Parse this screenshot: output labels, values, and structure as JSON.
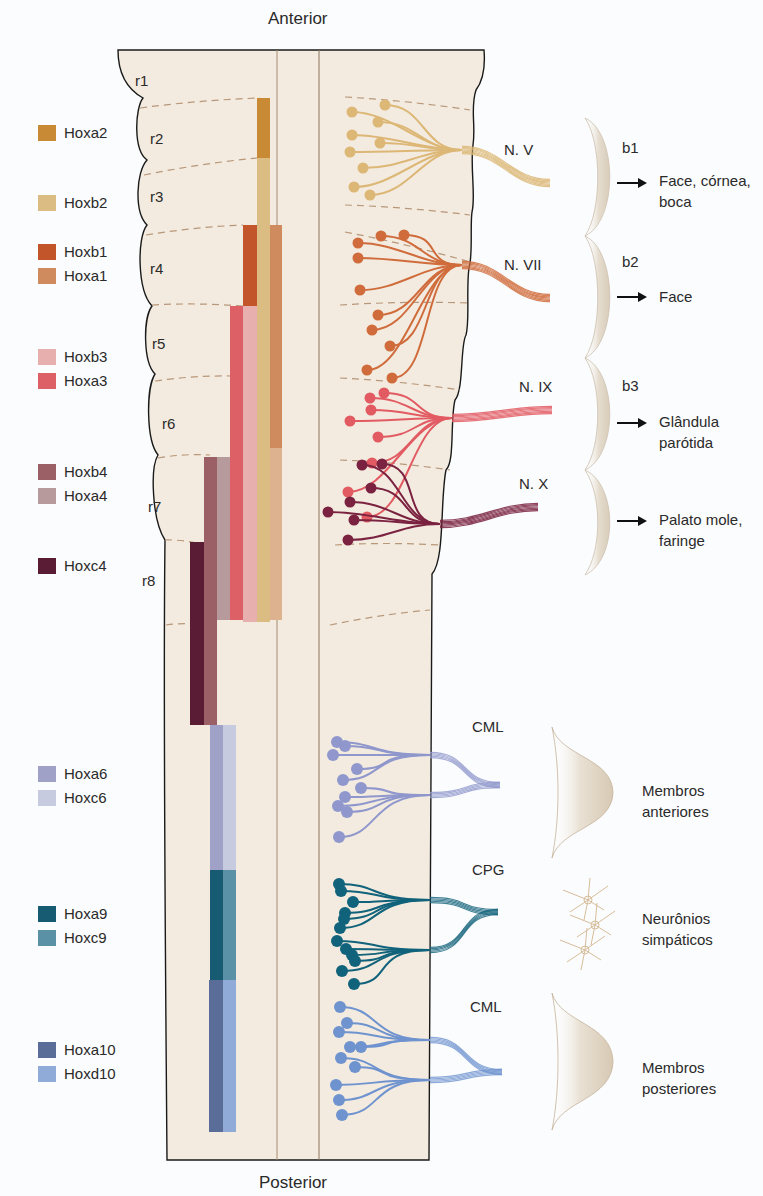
{
  "axis": {
    "top": "Anterior",
    "bottom": "Posterior"
  },
  "rhombomeres": [
    {
      "label": "r1",
      "x": 135,
      "y": 72
    },
    {
      "label": "r2",
      "x": 150,
      "y": 130
    },
    {
      "label": "r3",
      "x": 150,
      "y": 188
    },
    {
      "label": "r4",
      "x": 150,
      "y": 260
    },
    {
      "label": "r5",
      "x": 152,
      "y": 335
    },
    {
      "label": "r6",
      "x": 162,
      "y": 415
    },
    {
      "label": "r7",
      "x": 148,
      "y": 498
    },
    {
      "label": "r8",
      "x": 142,
      "y": 572
    }
  ],
  "legend": [
    {
      "gene": "Hoxa2",
      "color": "#c98a35",
      "y": 133
    },
    {
      "gene": "Hoxb2",
      "color": "#dbbd84",
      "y": 203
    },
    {
      "gene": "Hoxb1",
      "color": "#c2552a",
      "y": 252
    },
    {
      "gene": "Hoxa1",
      "color": "#cf8a5e",
      "y": 276
    },
    {
      "gene": "Hoxb3",
      "color": "#e7afae",
      "y": 357
    },
    {
      "gene": "Hoxa3",
      "color": "#dc6066",
      "y": 381
    },
    {
      "gene": "Hoxb4",
      "color": "#9a6066",
      "y": 472
    },
    {
      "gene": "Hoxa4",
      "color": "#b79a9c",
      "y": 496
    },
    {
      "gene": "Hoxc4",
      "color": "#5a1c35",
      "y": 566
    },
    {
      "gene": "Hoxa6",
      "color": "#9fa1c7",
      "y": 774
    },
    {
      "gene": "Hoxc6",
      "color": "#c7cbe0",
      "y": 798
    },
    {
      "gene": "Hoxa9",
      "color": "#165b72",
      "y": 914
    },
    {
      "gene": "Hoxc9",
      "color": "#5b91a6",
      "y": 938
    },
    {
      "gene": "Hoxa10",
      "color": "#5a6d98",
      "y": 1050
    },
    {
      "gene": "Hoxd10",
      "color": "#90abd7",
      "y": 1074
    }
  ],
  "expression_bars": [
    {
      "gene": "Hoxa2",
      "color": "#c98a35",
      "x": 257,
      "w": 13,
      "y0": 98,
      "y1": 158
    },
    {
      "gene": "Hoxb2",
      "color": "#dbbd84",
      "x": 257,
      "w": 13,
      "y0": 158,
      "y1": 622
    },
    {
      "gene": "Hoxb1",
      "color": "#c2552a",
      "x": 243,
      "w": 14,
      "y0": 225,
      "y1": 306
    },
    {
      "gene": "Hoxa1",
      "color": "#cf8a5e",
      "x": 270,
      "w": 12,
      "y0": 225,
      "y1": 448
    },
    {
      "gene": "Hoxa1-fade",
      "color": "#ddb28f",
      "x": 270,
      "w": 12,
      "y0": 448,
      "y1": 620
    },
    {
      "gene": "Hoxb3",
      "color": "#e7afae",
      "x": 243,
      "w": 14,
      "y0": 306,
      "y1": 622
    },
    {
      "gene": "Hoxa3",
      "color": "#dc6066",
      "x": 230,
      "w": 13,
      "y0": 306,
      "y1": 620
    },
    {
      "gene": "Hoxa4",
      "color": "#b79a9c",
      "x": 217,
      "w": 13,
      "y0": 457,
      "y1": 620
    },
    {
      "gene": "Hoxb4",
      "color": "#9a6066",
      "x": 204,
      "w": 13,
      "y0": 457,
      "y1": 725
    },
    {
      "gene": "Hoxc4",
      "color": "#5a1c35",
      "x": 190,
      "w": 14,
      "y0": 542,
      "y1": 725
    },
    {
      "gene": "Hoxa6",
      "color": "#9fa1c7",
      "x": 210,
      "w": 13,
      "y0": 725,
      "y1": 870
    },
    {
      "gene": "Hoxc6",
      "color": "#c7cbe0",
      "x": 223,
      "w": 13,
      "y0": 725,
      "y1": 870
    },
    {
      "gene": "Hoxa9",
      "color": "#165b72",
      "x": 210,
      "w": 13,
      "y0": 870,
      "y1": 980
    },
    {
      "gene": "Hoxc9",
      "color": "#5b91a6",
      "x": 223,
      "w": 13,
      "y0": 870,
      "y1": 980
    },
    {
      "gene": "Hoxa10",
      "color": "#5a6d98",
      "x": 209,
      "w": 14,
      "y0": 980,
      "y1": 1132
    },
    {
      "gene": "Hoxd10",
      "color": "#90abd7",
      "x": 223,
      "w": 13,
      "y0": 980,
      "y1": 1132
    }
  ],
  "nerves": [
    {
      "name": "N. V",
      "label_x": 504,
      "label_y": 150,
      "color": "#dcb776",
      "exit_y": 150,
      "tail_end": [
        550,
        183
      ],
      "somata": [
        [
          352,
          112
        ],
        [
          385,
          105
        ],
        [
          378,
          122
        ],
        [
          352,
          135
        ],
        [
          380,
          143
        ],
        [
          350,
          152
        ],
        [
          363,
          168
        ],
        [
          354,
          187
        ],
        [
          370,
          195
        ]
      ]
    },
    {
      "name": "N. VII",
      "label_x": 504,
      "label_y": 265,
      "color": "#d06c3c",
      "exit_y": 265,
      "tail_end": [
        550,
        298
      ],
      "somata": [
        [
          358,
          243
        ],
        [
          381,
          236
        ],
        [
          404,
          235
        ],
        [
          358,
          258
        ],
        [
          360,
          290
        ],
        [
          378,
          315
        ],
        [
          372,
          330
        ],
        [
          390,
          346
        ],
        [
          367,
          370
        ],
        [
          392,
          378
        ]
      ]
    },
    {
      "name": "N. IX",
      "label_x": 519,
      "label_y": 387,
      "color": "#e25b63",
      "exit_y": 418,
      "tail_end": [
        552,
        410
      ],
      "somata": [
        [
          370,
          398
        ],
        [
          384,
          393
        ],
        [
          371,
          410
        ],
        [
          350,
          421
        ],
        [
          378,
          437
        ],
        [
          372,
          463
        ],
        [
          348,
          492
        ],
        [
          367,
          517
        ]
      ]
    },
    {
      "name": "N. X",
      "label_x": 519,
      "label_y": 484,
      "color": "#7a2240",
      "exit_y": 524,
      "tail_end": [
        538,
        507
      ],
      "somata": [
        [
          362,
          465
        ],
        [
          382,
          464
        ],
        [
          371,
          488
        ],
        [
          350,
          502
        ],
        [
          354,
          520
        ],
        [
          328,
          512
        ],
        [
          348,
          540
        ]
      ]
    }
  ],
  "arches": [
    {
      "label": "b1",
      "label_x": 622,
      "label_y": 148,
      "y0": 118,
      "y1": 236
    },
    {
      "label": "b2",
      "label_x": 622,
      "label_y": 262,
      "y0": 236,
      "y1": 358
    },
    {
      "label": "b3",
      "label_x": 622,
      "label_y": 386,
      "y0": 358,
      "y1": 470
    },
    {
      "label": "",
      "label_x": 0,
      "label_y": 0,
      "y0": 470,
      "y1": 575
    }
  ],
  "targets": [
    {
      "lines": [
        "Face, córnea,",
        "boca"
      ],
      "arrow_y": 182,
      "x": 659,
      "y": 170
    },
    {
      "lines": [
        "Face"
      ],
      "arrow_y": 296,
      "x": 659,
      "y": 286
    },
    {
      "lines": [
        "Glândula",
        "parótida"
      ],
      "arrow_y": 422,
      "x": 659,
      "y": 411
    },
    {
      "lines": [
        "Palato mole,",
        "faringe"
      ],
      "arrow_y": 520,
      "x": 659,
      "y": 509
    }
  ],
  "motor_columns": [
    {
      "name": "CML",
      "label_x": 472,
      "label_y": 727,
      "color": "#8f97cc",
      "somata": [
        [
          337,
          742
        ],
        [
          345,
          746
        ],
        [
          333,
          755
        ],
        [
          357,
          769
        ],
        [
          343,
          780
        ],
        [
          361,
          788
        ],
        [
          345,
          797
        ],
        [
          338,
          806
        ],
        [
          347,
          812
        ],
        [
          339,
          837
        ]
      ],
      "join_y": [
        755,
        795
      ],
      "tip": [
        500,
        785
      ]
    },
    {
      "name": "CPG",
      "label_x": 472,
      "label_y": 870,
      "color": "#11627b",
      "somata": [
        [
          339,
          884
        ],
        [
          341,
          891
        ],
        [
          353,
          902
        ],
        [
          345,
          913
        ],
        [
          344,
          919
        ],
        [
          340,
          928
        ],
        [
          337,
          941
        ],
        [
          346,
          949
        ],
        [
          352,
          955
        ],
        [
          355,
          961
        ],
        [
          342,
          971
        ],
        [
          354,
          984
        ]
      ],
      "join_y": [
        900,
        950
      ],
      "tip": [
        498,
        912
      ]
    },
    {
      "name": "CML",
      "label_x": 470,
      "label_y": 1007,
      "color": "#6f93cf",
      "somata": [
        [
          340,
          1007
        ],
        [
          347,
          1023
        ],
        [
          339,
          1032
        ],
        [
          350,
          1047
        ],
        [
          361,
          1047
        ],
        [
          341,
          1058
        ],
        [
          355,
          1067
        ],
        [
          336,
          1085
        ],
        [
          339,
          1100
        ],
        [
          342,
          1115
        ]
      ],
      "join_y": [
        1040,
        1080
      ],
      "tip": [
        502,
        1072
      ]
    }
  ],
  "limb_targets": [
    {
      "label": [
        "Membros",
        "anteriores"
      ],
      "x": 642,
      "y": 780,
      "y0": 727,
      "y1": 858
    },
    {
      "label": [
        "Neurônios",
        "simpáticos"
      ],
      "x": 642,
      "y": 908
    },
    {
      "label": [
        "Membros",
        "posteriores"
      ],
      "x": 642,
      "y": 1057,
      "y0": 993,
      "y1": 1130
    }
  ],
  "colors": {
    "tissue": "#f3ebdf",
    "outline": "#1a1a1a",
    "dash": "#b8977a",
    "arch": "#e4dccf"
  }
}
